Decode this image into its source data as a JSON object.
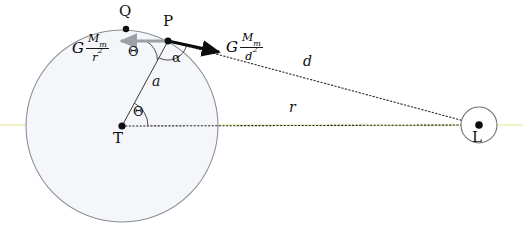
{
  "figure": {
    "type": "geometry-diagram",
    "background_color": "#ffffff",
    "width": 523,
    "height": 232
  },
  "colors": {
    "planet_fill": "#f4f6fa",
    "planet_stroke": "#8a8f98",
    "moon_fill": "#ffffff",
    "moon_stroke": "#6e727a",
    "line_dark": "#1a1a1a",
    "line_dotted": "#2b2b2b",
    "arrow_gray": "#9aa0a6",
    "arrow_black": "#0d0d0d",
    "axis_yellow": "#f3f3cf",
    "text": "#111111"
  },
  "points": [
    {
      "id": "Q",
      "label": "Q",
      "cx": 126,
      "cy": 29,
      "label_x": 119,
      "label_y": 4,
      "dot_r": 3.2
    },
    {
      "id": "P",
      "label": "P",
      "cx": 168,
      "cy": 41,
      "label_x": 163,
      "label_y": 14,
      "dot_r": 3.4
    },
    {
      "id": "T",
      "label": "T",
      "cx": 122,
      "cy": 126,
      "label_x": 113,
      "label_y": 131,
      "dot_r": 3.6
    },
    {
      "id": "L",
      "label": "L",
      "cx": 479,
      "cy": 125,
      "label_x": 472,
      "label_y": 130,
      "dot_r": 3.8
    }
  ],
  "circles": {
    "planet": {
      "name": "planet-circle",
      "cx": 122,
      "cy": 126,
      "r": 96
    },
    "moon": {
      "name": "moon-circle",
      "cx": 479,
      "cy": 125,
      "r": 18
    }
  },
  "segments": [
    {
      "id": "a",
      "name": "segment-a-T-to-P",
      "style": "solid-thin",
      "x1": 122,
      "y1": 126,
      "x2": 168,
      "y2": 41
    },
    {
      "id": "r",
      "name": "segment-r-T-to-L",
      "style": "dotted",
      "x1": 122,
      "y1": 126,
      "x2": 479,
      "y2": 125
    },
    {
      "id": "d",
      "name": "segment-d-P-to-L",
      "style": "dotted",
      "x1": 168,
      "y1": 41,
      "x2": 479,
      "y2": 125
    }
  ],
  "length_labels": [
    {
      "id": "a",
      "text": "a",
      "x": 152,
      "y": 74
    },
    {
      "id": "d",
      "text": "d",
      "x": 303,
      "y": 54
    },
    {
      "id": "r",
      "text": "r",
      "x": 289,
      "y": 100
    }
  ],
  "angles": [
    {
      "id": "theta-T",
      "text": "Θ",
      "x": 133,
      "y": 105,
      "vertex": "T",
      "arc": {
        "cx": 122,
        "cy": 126,
        "r": 26,
        "start_deg": -61.6,
        "end_deg": 0
      }
    },
    {
      "id": "theta-P",
      "text": "Θ",
      "x": 128,
      "y": 45,
      "vertex": "P",
      "arc": {
        "cx": 168,
        "cy": 41,
        "r": 22,
        "start_deg": 180,
        "end_deg": 118.4
      }
    },
    {
      "id": "alpha-P",
      "text": "α",
      "x": 172,
      "y": 51,
      "vertex": "P",
      "arc": {
        "cx": 168,
        "cy": 41,
        "r": 19,
        "start_deg": 118.4,
        "end_deg": 15
      }
    }
  ],
  "vectors": [
    {
      "id": "force-moon-at-center",
      "name": "gray-force-arrow",
      "color": "#9aa0a6",
      "width": 3,
      "x1": 168,
      "y1": 41,
      "x2": 118,
      "y2": 41,
      "label": {
        "G": "G",
        "numerator": "M",
        "numerator_sub": "m",
        "denominator": "r",
        "denominator_sup": "2",
        "x": 72,
        "y": 33
      }
    },
    {
      "id": "force-moon-at-P",
      "name": "black-force-arrow",
      "color": "#0d0d0d",
      "width": 3.4,
      "x1": 168,
      "y1": 41,
      "x2": 222,
      "y2": 53,
      "label": {
        "G": "G",
        "numerator": "M",
        "numerator_sub": "m",
        "denominator": "d",
        "denominator_sup": "2",
        "x": 226,
        "y": 32
      }
    }
  ],
  "axis_line": {
    "name": "horizontal-axis-line",
    "y": 125,
    "x1": 0,
    "x2": 523,
    "color": "#f3f3cf"
  }
}
